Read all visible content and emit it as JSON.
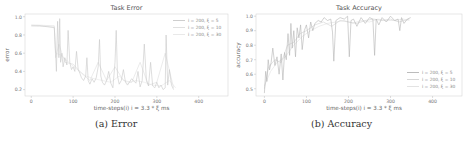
{
  "chart_data": [
    {
      "type": "line",
      "title": "Task Error",
      "xlabel": "time-steps(i)     i = 3.3 * ξ ms",
      "ylabel": "error",
      "caption": "(a) Error",
      "xlim": [
        -15,
        470
      ],
      "ylim": [
        0.13,
        1.03
      ],
      "xticks": [
        0,
        100,
        200,
        300,
        400
      ],
      "yticks": [
        0.2,
        0.4,
        0.6,
        0.8,
        1.0
      ],
      "ytick_labels": [
        "0.2",
        "0.4",
        "0.6",
        "0.8",
        "1.0"
      ],
      "grid": false,
      "legend_position": "upper right",
      "series": [
        {
          "name": "i = 200, ξ = 5",
          "color": "#c8c8c8",
          "x": [
            0,
            20,
            40,
            55,
            58,
            60,
            63,
            66,
            68,
            70,
            73,
            76,
            80,
            85,
            88,
            92,
            96,
            100,
            104,
            108,
            112,
            116,
            120,
            125,
            130,
            133,
            136,
            140,
            145,
            150,
            155,
            160,
            163,
            166,
            170,
            175,
            180,
            185,
            190,
            195,
            200,
            203,
            206,
            210,
            215,
            220,
            225,
            230,
            240,
            250,
            255,
            260,
            265,
            270,
            275,
            280,
            285,
            290,
            295,
            300,
            305,
            310,
            315,
            320,
            322,
            326,
            330,
            335,
            340
          ],
          "values": [
            0.9,
            0.9,
            0.89,
            0.88,
            0.6,
            0.4,
            0.95,
            0.55,
            0.98,
            0.5,
            0.6,
            0.45,
            0.55,
            0.47,
            0.85,
            0.5,
            0.42,
            0.45,
            0.4,
            0.62,
            0.42,
            0.38,
            0.33,
            0.3,
            0.35,
            0.55,
            0.3,
            0.26,
            0.32,
            0.28,
            0.33,
            0.45,
            0.75,
            0.35,
            0.28,
            0.25,
            0.3,
            0.4,
            0.27,
            0.22,
            0.5,
            0.85,
            0.35,
            0.26,
            0.3,
            0.42,
            0.28,
            0.25,
            0.32,
            0.27,
            0.4,
            0.23,
            0.3,
            0.7,
            0.3,
            0.24,
            0.5,
            0.24,
            0.22,
            0.28,
            0.22,
            0.25,
            0.2,
            0.22,
            0.8,
            0.25,
            0.42,
            0.25,
            0.2
          ]
        },
        {
          "name": "i = 200, ξ = 10",
          "color": "#dddddd",
          "x": [
            0,
            55,
            58,
            66,
            80,
            100,
            120,
            140,
            160,
            180,
            200,
            220,
            240,
            260,
            280,
            300,
            320,
            340
          ],
          "values": [
            0.91,
            0.9,
            0.55,
            0.7,
            0.5,
            0.48,
            0.38,
            0.3,
            0.5,
            0.3,
            0.45,
            0.3,
            0.28,
            0.5,
            0.25,
            0.28,
            0.6,
            0.22
          ]
        },
        {
          "name": "i = 200, ξ = 30",
          "color": "#e6e6e6",
          "x": [
            0,
            55,
            58,
            70,
            90,
            110,
            130,
            150,
            170,
            190,
            210,
            230,
            250,
            270,
            290,
            310,
            330,
            345
          ],
          "values": [
            0.9,
            0.89,
            0.6,
            0.58,
            0.5,
            0.42,
            0.35,
            0.32,
            0.3,
            0.28,
            0.35,
            0.27,
            0.3,
            0.28,
            0.25,
            0.24,
            0.3,
            0.22
          ]
        }
      ]
    },
    {
      "type": "line",
      "title": "Task Accuracy",
      "xlabel": "time-steps(i)     i = 3.3 * ξ ms",
      "ylabel": "accuracy",
      "caption": "(b) Accuracy",
      "xlim": [
        -20,
        470
      ],
      "ylim": [
        0.45,
        1.015
      ],
      "xticks": [
        0,
        100,
        200,
        300,
        400
      ],
      "yticks": [
        0.5,
        0.6,
        0.7,
        0.8,
        0.9,
        1.0
      ],
      "ytick_labels": [
        "0.5",
        "0.6",
        "0.7",
        "0.8",
        "0.9",
        "1.0"
      ],
      "grid": false,
      "legend_position": "lower right",
      "series": [
        {
          "name": "i = 200, ξ = 5",
          "color": "#b4b4b4",
          "x": [
            0,
            3,
            6,
            9,
            12,
            16,
            20,
            25,
            30,
            35,
            40,
            44,
            48,
            52,
            56,
            60,
            63,
            66,
            70,
            74,
            78,
            82,
            86,
            90,
            95,
            100,
            105,
            110,
            115,
            120,
            128,
            135,
            142,
            150,
            158,
            162,
            165,
            170,
            180,
            190,
            198,
            202,
            206,
            212,
            220,
            230,
            240,
            250,
            258,
            262,
            266,
            272,
            280,
            290,
            300,
            310,
            318,
            322,
            326,
            332,
            340,
            348
          ],
          "values": [
            0.47,
            0.62,
            0.55,
            0.7,
            0.63,
            0.68,
            0.78,
            0.66,
            0.72,
            0.6,
            0.74,
            0.56,
            0.75,
            0.7,
            0.88,
            0.73,
            0.95,
            0.78,
            0.9,
            0.72,
            0.92,
            0.85,
            0.94,
            0.77,
            0.9,
            0.94,
            0.85,
            0.96,
            0.9,
            0.95,
            0.97,
            0.96,
            0.99,
            0.97,
            0.98,
            0.89,
            0.69,
            0.97,
            0.99,
            0.98,
            1.0,
            0.72,
            0.97,
            0.98,
            0.93,
            0.99,
            0.95,
            0.99,
            0.98,
            0.73,
            0.98,
            0.94,
            0.99,
            0.96,
            1.0,
            0.97,
            0.98,
            0.9,
            0.99,
            0.95,
            0.98,
            0.99
          ]
        },
        {
          "name": "i = 200, ξ = 10",
          "color": "#d2d2d2",
          "x": [
            0,
            10,
            25,
            40,
            55,
            70,
            85,
            100,
            120,
            140,
            160,
            180,
            200,
            220,
            240,
            260,
            280,
            300,
            320,
            345
          ],
          "values": [
            0.5,
            0.65,
            0.7,
            0.68,
            0.8,
            0.82,
            0.88,
            0.9,
            0.94,
            0.96,
            0.93,
            0.97,
            0.96,
            0.95,
            0.97,
            0.98,
            0.97,
            0.98,
            0.96,
            0.98
          ]
        },
        {
          "name": "i = 200, ξ = 30",
          "color": "#e0e0e0",
          "x": [
            0,
            15,
            30,
            50,
            70,
            90,
            110,
            130,
            150,
            170,
            190,
            210,
            230,
            250,
            270,
            290,
            310,
            330,
            345
          ],
          "values": [
            0.52,
            0.62,
            0.68,
            0.72,
            0.8,
            0.86,
            0.9,
            0.93,
            0.95,
            0.96,
            0.97,
            0.95,
            0.97,
            0.96,
            0.98,
            0.97,
            0.97,
            0.98,
            0.97
          ]
        }
      ]
    }
  ]
}
